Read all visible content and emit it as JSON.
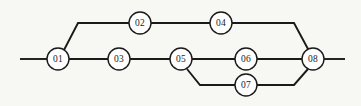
{
  "diagram": {
    "type": "node-link-graph",
    "canvas": {
      "width": 361,
      "height": 106
    },
    "style": {
      "background_color": "#f7f7f4",
      "line_color": "#1a1a1a",
      "node_fill": "#ffffff",
      "node_stroke": "#1a1a1a",
      "node_radius": 11
    },
    "nodes": [
      {
        "id": "n01",
        "label": "01",
        "x": 58,
        "y": 59
      },
      {
        "id": "n02",
        "label": "02",
        "x": 140,
        "y": 23
      },
      {
        "id": "n03",
        "label": "03",
        "x": 119,
        "y": 59
      },
      {
        "id": "n04",
        "label": "04",
        "x": 221,
        "y": 23
      },
      {
        "id": "n05",
        "label": "05",
        "x": 181,
        "y": 59
      },
      {
        "id": "n06",
        "label": "06",
        "x": 246,
        "y": 59
      },
      {
        "id": "n07",
        "label": "07",
        "x": 246,
        "y": 85
      },
      {
        "id": "n08",
        "label": "08",
        "x": 313,
        "y": 59
      }
    ],
    "edges": [
      {
        "id": "e-stub-left",
        "from": "terminal-left",
        "to": "n01",
        "points": "20,59 47,59"
      },
      {
        "id": "e-01-02",
        "from": "n01",
        "to": "n02",
        "points": "64,50 78,23 129,23"
      },
      {
        "id": "e-01-03",
        "from": "n01",
        "to": "n03",
        "points": "69,59 108,59"
      },
      {
        "id": "e-02-04",
        "from": "n02",
        "to": "n04",
        "points": "151,23 210,23"
      },
      {
        "id": "e-03-05",
        "from": "n03",
        "to": "n05",
        "points": "130,59 170,59"
      },
      {
        "id": "e-04-08",
        "from": "n04",
        "to": "n08",
        "points": "232,23 294,23 308,49"
      },
      {
        "id": "e-05-06",
        "from": "n05",
        "to": "n06",
        "points": "192,59 235,59"
      },
      {
        "id": "e-05-07",
        "from": "n05",
        "to": "n07",
        "points": "187,69 200,85 235,85"
      },
      {
        "id": "e-06-08",
        "from": "n06",
        "to": "n08",
        "points": "257,59 302,59"
      },
      {
        "id": "e-07-08",
        "from": "n07",
        "to": "n08",
        "points": "257,85 294,85 308,69"
      },
      {
        "id": "e-stub-right",
        "from": "n08",
        "to": "terminal-right",
        "points": "324,59 345,59"
      }
    ]
  }
}
